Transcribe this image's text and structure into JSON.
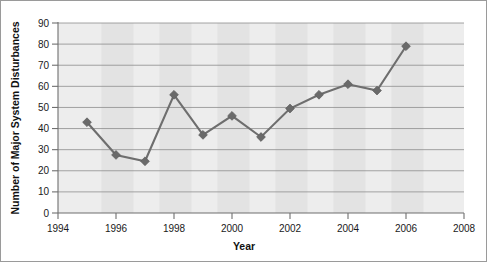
{
  "chart_data": {
    "type": "line",
    "title": "",
    "xlabel": "Year",
    "ylabel": "Number of Major System Disturbances",
    "x": [
      1995,
      1996,
      1997,
      1998,
      1999,
      2000,
      2001,
      2002,
      2003,
      2004,
      2005,
      2006
    ],
    "values": [
      43,
      27.5,
      24.5,
      56,
      37,
      46,
      36,
      49.5,
      56,
      61,
      58,
      79
    ],
    "series": [
      {
        "name": "Major System Disturbances",
        "values": [
          43,
          27.5,
          24.5,
          56,
          37,
          46,
          36,
          49.5,
          56,
          61,
          58,
          79
        ]
      }
    ],
    "xlim": [
      1994,
      2008
    ],
    "ylim": [
      0,
      90
    ],
    "x_tick_labels": [
      "1994",
      "1996",
      "1998",
      "2000",
      "2002",
      "2004",
      "2006",
      "2008"
    ],
    "x_tick_values": [
      1994,
      1996,
      1998,
      2000,
      2002,
      2004,
      2006,
      2008
    ],
    "y_tick_labels": [
      "0",
      "10",
      "20",
      "30",
      "40",
      "50",
      "60",
      "70",
      "80",
      "90"
    ],
    "y_tick_values": [
      0,
      10,
      20,
      30,
      40,
      50,
      60,
      70,
      80,
      90
    ],
    "grid": true,
    "grid_axis": "y",
    "legend": false,
    "legend_position": "none",
    "marker": "diamond",
    "colors": {
      "line": "#6e6e6e",
      "marker": "#6a6a6a",
      "grid": "#8d8d8d",
      "axis": "#6f6f6f",
      "plot_background": "#ededed",
      "band": "#d9d9d9",
      "figure_background": "#ffffff",
      "text": "#111111"
    },
    "background_bands": [
      {
        "from": 1995.5,
        "to": 1996.6
      },
      {
        "from": 1997.5,
        "to": 1998.6
      },
      {
        "from": 1999.5,
        "to": 2000.6
      },
      {
        "from": 2001.5,
        "to": 2002.6
      },
      {
        "from": 2003.5,
        "to": 2004.6
      },
      {
        "from": 2005.5,
        "to": 2006.6
      }
    ]
  }
}
